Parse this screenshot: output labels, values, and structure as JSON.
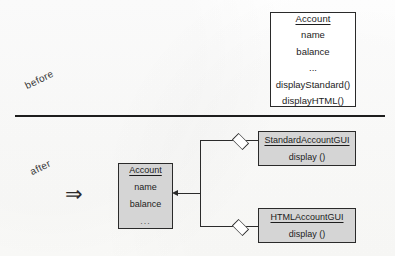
{
  "diagram": {
    "type": "uml-class-diagram",
    "sections": [
      {
        "id": "before",
        "label": "before"
      },
      {
        "id": "after",
        "label": "after"
      }
    ],
    "transform_glyph": "⇒",
    "colors": {
      "box_fill_before": "#ffffff",
      "box_fill_after": "#d5d5d5",
      "line": "#2b2b2b",
      "divider": "#1d1d1d",
      "page": "#fdfdfc"
    }
  },
  "before": {
    "account_class": {
      "name": "Account",
      "members": [
        "name",
        "balance",
        "...",
        "displayStandard()",
        "displayHTML()"
      ]
    }
  },
  "after": {
    "account_class": {
      "name": "Account",
      "members": [
        "name",
        "balance",
        "..."
      ]
    },
    "standard_gui_class": {
      "name": "StandardAccountGUI",
      "members": [
        "display ()"
      ]
    },
    "html_gui_class": {
      "name": "HTMLAccountGUI",
      "members": [
        "display ()"
      ]
    },
    "relationships": [
      {
        "from": "StandardAccountGUI",
        "to": "Account",
        "kind": "aggregation",
        "source_marker": "hollow-diamond",
        "target_marker": "open-arrow"
      },
      {
        "from": "HTMLAccountGUI",
        "to": "Account",
        "kind": "aggregation",
        "source_marker": "hollow-diamond",
        "target_marker": "open-arrow"
      }
    ]
  }
}
